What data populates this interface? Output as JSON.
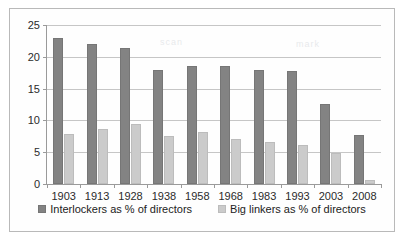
{
  "chart_data": {
    "type": "bar",
    "title": "",
    "subtitle": "",
    "xlabel": "",
    "ylabel": "",
    "categories": [
      "1903",
      "1913",
      "1928",
      "1938",
      "1958",
      "1968",
      "1983",
      "1993",
      "2003",
      "2008"
    ],
    "series": [
      {
        "name": "Interlockers as % of directors",
        "color": "#838383",
        "values": [
          23.0,
          22.0,
          21.4,
          18.0,
          18.5,
          18.5,
          18.0,
          17.7,
          12.6,
          7.7
        ]
      },
      {
        "name": "Big linkers as % of directors",
        "color": "#cbcbcb",
        "values": [
          7.9,
          8.6,
          9.4,
          7.6,
          8.2,
          7.1,
          6.6,
          6.1,
          4.8,
          0.6
        ]
      }
    ],
    "ylim": [
      0,
      25
    ],
    "yticks": [
      0,
      5,
      10,
      15,
      20,
      25
    ],
    "ytick_labels": [
      "0",
      "5",
      "10",
      "15",
      "20",
      "25"
    ],
    "grid": true,
    "grid_axis": "y",
    "legend_position": "bottom"
  },
  "legend": {
    "entries": [
      {
        "label": "Interlockers as % of directors"
      },
      {
        "label": "Big linkers as % of directors"
      }
    ]
  },
  "artifacts": {
    "smudge_top": "scan",
    "smudge_mid": "mark"
  }
}
